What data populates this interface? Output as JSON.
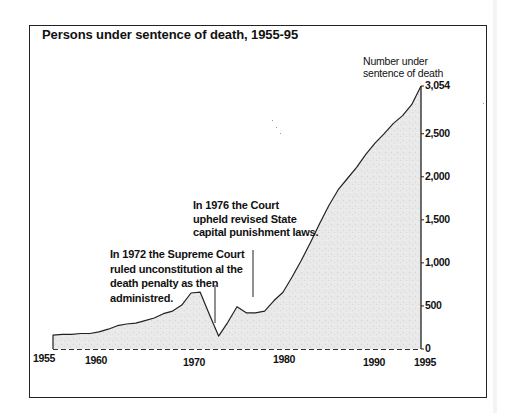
{
  "chart_data": {
    "type": "area",
    "title": "Persons under sentence of death, 1955-95",
    "xlabel": "",
    "ylabel": "Number under sentence of death",
    "ylabel_lines": [
      "Number under",
      "sentence of death"
    ],
    "x": [
      1955,
      1956,
      1957,
      1958,
      1959,
      1960,
      1961,
      1962,
      1963,
      1964,
      1965,
      1966,
      1967,
      1968,
      1969,
      1970,
      1971,
      1972,
      1973,
      1974,
      1975,
      1976,
      1977,
      1978,
      1979,
      1980,
      1981,
      1982,
      1983,
      1984,
      1985,
      1986,
      1987,
      1988,
      1989,
      1990,
      1991,
      1992,
      1993,
      1994,
      1995
    ],
    "series": [
      {
        "name": "Persons under sentence of death",
        "values": [
          160,
          170,
          170,
          180,
          180,
          200,
          230,
          270,
          290,
          300,
          330,
          360,
          410,
          440,
          510,
          650,
          660,
          400,
          150,
          310,
          490,
          420,
          420,
          440,
          560,
          660,
          840,
          1030,
          1240,
          1460,
          1670,
          1850,
          1980,
          2110,
          2260,
          2390,
          2500,
          2620,
          2710,
          2840,
          3054
        ]
      }
    ],
    "xticks": [
      "1955",
      "1960",
      "1970",
      "1980",
      "1990",
      "1995"
    ],
    "xtick_values": [
      1955,
      1960,
      1970,
      1980,
      1990,
      1995
    ],
    "yticks": [
      "0",
      "500",
      "1,000",
      "1,500",
      "2,000",
      "2,500",
      "3,054"
    ],
    "ytick_values": [
      0,
      500,
      1000,
      1500,
      2000,
      2500,
      3054
    ],
    "xlim": [
      1955,
      1995
    ],
    "ylim": [
      0,
      3054
    ],
    "yaxis_position": "right",
    "grid": false,
    "baseline_style": "dashed",
    "fill_color": "#e6e6e6",
    "line_color": "#222222",
    "annotations": [
      {
        "year": 1972,
        "lines": [
          "In 1972 the Supreme Court",
          "ruled unconstitution al the",
          "death penalty as then",
          "administred."
        ]
      },
      {
        "year": 1976,
        "lines": [
          "In 1976 the Court",
          "upheld revised State",
          "capital punishment laws."
        ]
      }
    ]
  }
}
